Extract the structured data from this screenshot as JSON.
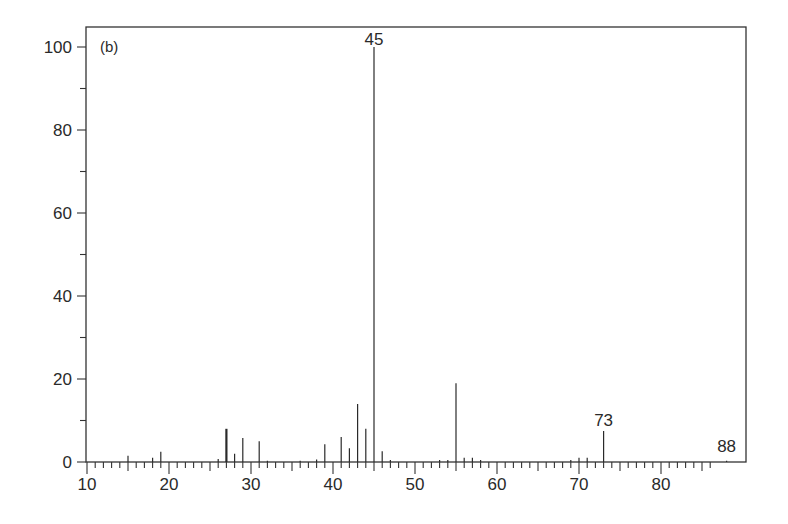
{
  "chart_data": {
    "type": "bar",
    "subtype": "mass-spectrum",
    "title": "",
    "panel_label": "(b)",
    "xlabel": "",
    "ylabel": "",
    "xlim": [
      10,
      89
    ],
    "ylim": [
      0,
      100
    ],
    "x_ticks": [
      10,
      20,
      30,
      40,
      50,
      60,
      70,
      80
    ],
    "y_ticks": [
      0,
      20,
      40,
      60,
      80,
      100
    ],
    "grid": false,
    "legend": null,
    "peaks": [
      {
        "mz": 15,
        "intensity": 1.5
      },
      {
        "mz": 18,
        "intensity": 1.0
      },
      {
        "mz": 19,
        "intensity": 2.5
      },
      {
        "mz": 26,
        "intensity": 0.7
      },
      {
        "mz": 27,
        "intensity": 8.0
      },
      {
        "mz": 28,
        "intensity": 2.0
      },
      {
        "mz": 29,
        "intensity": 5.8
      },
      {
        "mz": 31,
        "intensity": 5.0
      },
      {
        "mz": 32,
        "intensity": 0.3
      },
      {
        "mz": 36,
        "intensity": 0.3
      },
      {
        "mz": 38,
        "intensity": 0.6
      },
      {
        "mz": 39,
        "intensity": 4.3
      },
      {
        "mz": 41,
        "intensity": 6.0
      },
      {
        "mz": 42,
        "intensity": 3.3
      },
      {
        "mz": 43,
        "intensity": 14.0
      },
      {
        "mz": 44,
        "intensity": 8.0
      },
      {
        "mz": 45,
        "intensity": 100.0
      },
      {
        "mz": 46,
        "intensity": 2.6
      },
      {
        "mz": 47,
        "intensity": 0.5
      },
      {
        "mz": 53,
        "intensity": 0.5
      },
      {
        "mz": 54,
        "intensity": 0.5
      },
      {
        "mz": 55,
        "intensity": 19.0
      },
      {
        "mz": 56,
        "intensity": 1.0
      },
      {
        "mz": 57,
        "intensity": 1.0
      },
      {
        "mz": 58,
        "intensity": 0.5
      },
      {
        "mz": 69,
        "intensity": 0.5
      },
      {
        "mz": 70,
        "intensity": 1.0
      },
      {
        "mz": 71,
        "intensity": 1.0
      },
      {
        "mz": 73,
        "intensity": 7.5
      },
      {
        "mz": 88,
        "intensity": 0.3
      }
    ],
    "annotations": [
      {
        "text": "45",
        "mz": 45,
        "intensity": 100
      },
      {
        "text": "73",
        "mz": 73,
        "intensity": 7.5
      },
      {
        "text": "88",
        "mz": 88,
        "intensity": 0.3
      }
    ]
  }
}
